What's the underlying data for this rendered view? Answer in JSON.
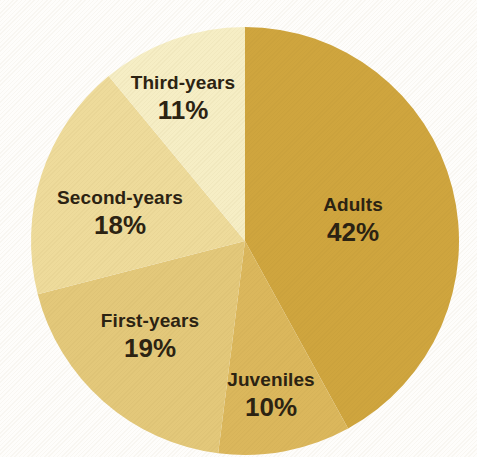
{
  "chart_data": {
    "type": "pie",
    "direction": "clockwise",
    "start_angle_deg": 0,
    "legend": "none",
    "background_color": "#fefdfb",
    "text_color": "#2b2212",
    "center": {
      "x": 245,
      "y": 241
    },
    "radius": 214,
    "slices": [
      {
        "label": "Adults",
        "value": 42,
        "pct_label": "42%",
        "color": "#cfa53e",
        "label_x": 353,
        "label_y": 220
      },
      {
        "label": "Juveniles",
        "value": 10,
        "pct_label": "10%",
        "color": "#dbb75c",
        "label_x": 271,
        "label_y": 395
      },
      {
        "label": "First-years",
        "value": 19,
        "pct_label": "19%",
        "color": "#e3c87a",
        "label_x": 150,
        "label_y": 336
      },
      {
        "label": "Second-years",
        "value": 18,
        "pct_label": "18%",
        "color": "#eedb9b",
        "label_x": 120,
        "label_y": 213
      },
      {
        "label": "Third-years",
        "value": 11,
        "pct_label": "11%",
        "color": "#f6eec5",
        "label_x": 183,
        "label_y": 98
      }
    ]
  }
}
